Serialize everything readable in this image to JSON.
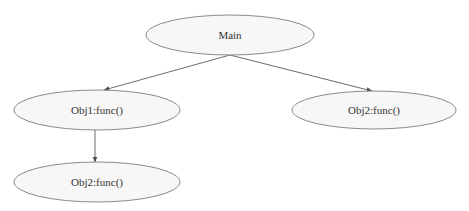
{
  "diagram": {
    "type": "call-tree",
    "style": {
      "node_fill": "#f7f7f7",
      "node_stroke": "#8a8a8a",
      "edge_color": "#6b6b6b",
      "text_color": "#333333"
    },
    "nodes": [
      {
        "id": "main",
        "label": "Main",
        "cx": 230,
        "cy": 35,
        "rx": 84,
        "ry": 20
      },
      {
        "id": "obj1_func",
        "label": "Obj1:func()",
        "cx": 97,
        "cy": 110,
        "rx": 83,
        "ry": 20
      },
      {
        "id": "obj2_func_right",
        "label": "Obj2:func()",
        "cx": 374,
        "cy": 110,
        "rx": 82,
        "ry": 19
      },
      {
        "id": "obj2_func_bottom",
        "label": "Obj2:func()",
        "cx": 97,
        "cy": 182,
        "rx": 83,
        "ry": 20
      }
    ],
    "edges": [
      {
        "from": "main",
        "to": "obj1_func"
      },
      {
        "from": "main",
        "to": "obj2_func_right"
      },
      {
        "from": "obj1_func",
        "to": "obj2_func_bottom"
      }
    ]
  }
}
